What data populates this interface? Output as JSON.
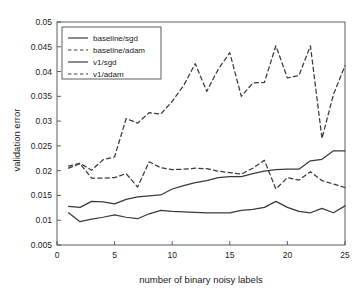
{
  "figure": {
    "background": "#ffffff",
    "line_color": "#3a3a3a",
    "axis_color": "#4d4d4d"
  },
  "chart_data": {
    "type": "line",
    "title": "",
    "xlabel": "number of binary noisy labels",
    "ylabel": "validation error",
    "xlim": [
      0,
      25
    ],
    "ylim": [
      0.005,
      0.05
    ],
    "xticks": [
      0,
      5,
      10,
      15,
      20,
      25
    ],
    "xticklabels": [
      "0",
      "5",
      "10",
      "15",
      "20",
      "25"
    ],
    "yticks": [
      0.005,
      0.01,
      0.015,
      0.02,
      0.025,
      0.03,
      0.035,
      0.04,
      0.045,
      0.05
    ],
    "yticklabels": [
      "0.005",
      "0.01",
      "0.015",
      "0.02",
      "0.025",
      "0.03",
      "0.035",
      "0.04",
      "0.045",
      "0.05"
    ],
    "grid": false,
    "legend_position": "upper left",
    "x": [
      1,
      2,
      3,
      4,
      5,
      6,
      7,
      8,
      9,
      10,
      11,
      12,
      13,
      14,
      15,
      16,
      17,
      18,
      19,
      20,
      21,
      22,
      23,
      24,
      25
    ],
    "series": [
      {
        "name": "baseline/sgd",
        "style": "solid",
        "values": [
          0.0128,
          0.0126,
          0.0138,
          0.0137,
          0.0133,
          0.0142,
          0.0147,
          0.0149,
          0.0151,
          0.0163,
          0.017,
          0.0176,
          0.018,
          0.0186,
          0.0188,
          0.0188,
          0.0194,
          0.0199,
          0.0202,
          0.0203,
          0.0203,
          0.022,
          0.0223,
          0.024,
          0.024
        ]
      },
      {
        "name": "baseline/adam",
        "style": "dashed",
        "values": [
          0.0205,
          0.0214,
          0.0185,
          0.0185,
          0.0186,
          0.0194,
          0.0167,
          0.0218,
          0.0206,
          0.0202,
          0.0203,
          0.0205,
          0.0204,
          0.0199,
          0.0196,
          0.0193,
          0.0205,
          0.0221,
          0.0163,
          0.0186,
          0.0181,
          0.0198,
          0.018,
          0.0173,
          0.0166
        ]
      },
      {
        "name": "v1/sgd",
        "style": "solid",
        "values": [
          0.0115,
          0.0097,
          0.0102,
          0.0106,
          0.0111,
          0.0106,
          0.0103,
          0.0113,
          0.012,
          0.0118,
          0.0117,
          0.0116,
          0.0115,
          0.0115,
          0.0115,
          0.012,
          0.0122,
          0.0126,
          0.0138,
          0.0126,
          0.0118,
          0.0115,
          0.0124,
          0.0115,
          0.0129
        ]
      },
      {
        "name": "v1/adam",
        "style": "dashed",
        "values": [
          0.0209,
          0.0215,
          0.0201,
          0.0222,
          0.0228,
          0.0305,
          0.0296,
          0.0317,
          0.0314,
          0.034,
          0.0372,
          0.0416,
          0.036,
          0.0405,
          0.0438,
          0.035,
          0.0377,
          0.0378,
          0.0452,
          0.0387,
          0.0392,
          0.0452,
          0.0265,
          0.0354,
          0.0412
        ]
      }
    ],
    "legend": [
      {
        "label": "baseline/sgd",
        "style": "solid"
      },
      {
        "label": "baseline/adam",
        "style": "dashed"
      },
      {
        "label": "v1/sgd",
        "style": "solid"
      },
      {
        "label": "v1/adam",
        "style": "dashed"
      }
    ]
  }
}
